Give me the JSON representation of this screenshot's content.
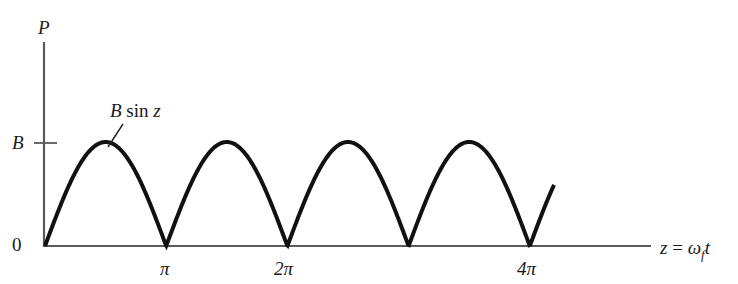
{
  "chart_data": {
    "type": "line",
    "title": "",
    "xlabel": "z = ω_f t",
    "ylabel": "P",
    "series": [
      {
        "name": "B sin z",
        "function": "|B sin z|",
        "x": [
          "0",
          "π/2",
          "π",
          "3π/2",
          "2π",
          "5π/2",
          "3π",
          "7π/2",
          "4π",
          "~4.2π"
        ],
        "values": [
          "0",
          "B",
          "0",
          "B",
          "0",
          "B",
          "0",
          "B",
          "0",
          "~0.8B"
        ]
      }
    ],
    "x_ticks": [
      "π",
      "2π",
      "4π"
    ],
    "y_ticks": [
      "0",
      "B"
    ],
    "xlim": [
      "0",
      "~4.8π"
    ],
    "ylim": [
      "0",
      "~1.9B"
    ],
    "grid": false,
    "legend": "none",
    "annotations": [
      {
        "text": "B sin z",
        "points_to": "first arch, right shoulder"
      }
    ]
  },
  "labels": {
    "y_axis": "P",
    "y_tick_b": "B",
    "y_tick_zero": "0",
    "x_tick_pi": "π",
    "x_tick_2pi": "2π",
    "x_tick_4pi": "4π",
    "x_axis_lhs": "z",
    "x_axis_eq": "=",
    "x_axis_omega": "ω",
    "x_axis_sub": "f",
    "x_axis_t": "t",
    "curve_label_b": "B",
    "curve_label_sin": "sin",
    "curve_label_z": "z"
  },
  "colors": {
    "axis": "#5a5a5a",
    "curve": "#111111",
    "text": "#1a1a1a"
  }
}
